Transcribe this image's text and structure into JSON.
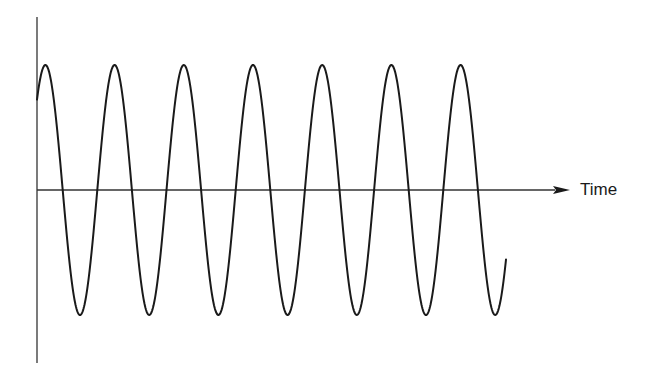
{
  "diagram": {
    "x_axis_label": "Time",
    "y_axis_label": "",
    "colors": {
      "background": "#ffffff",
      "line": "#1a1a1a",
      "axis": "#333333"
    }
  },
  "chart_data": {
    "type": "line",
    "title": "",
    "xlabel": "Time",
    "ylabel": "",
    "function": "sine",
    "cycles_shown": 6.8,
    "peaks": 7,
    "troughs": 7,
    "amplitude": 1,
    "grid": false,
    "legend": null
  },
  "geometry": {
    "y_axis": {
      "x": 37,
      "y1": 17,
      "y2": 363
    },
    "x_axis": {
      "y": 190,
      "x1": 37,
      "x2": 570
    },
    "arrow": {
      "tip_x": 570,
      "base_x": 553,
      "half_height": 4
    },
    "wave": {
      "x_start": 37,
      "x_end": 506,
      "first_trough_x": 80,
      "period": 69.2,
      "amplitude_px": 125,
      "center_y": 190
    },
    "label": {
      "x": 580,
      "y": 181
    }
  }
}
